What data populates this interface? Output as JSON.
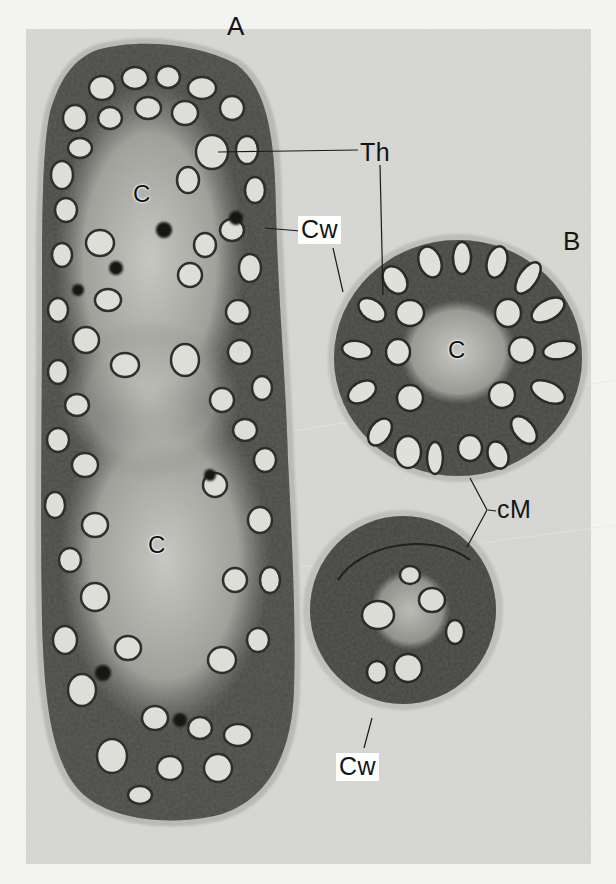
{
  "figure": {
    "background_color": "#f3f3f1",
    "panel_color": "#d8d8d5",
    "cell_dark": "#3a3a38",
    "cell_mid": "#8a8a86",
    "thylakoid_light": "#e2e2de",
    "panels": [
      {
        "id": "A",
        "label": "A"
      },
      {
        "id": "B",
        "label": "B"
      }
    ],
    "labels": {
      "panel_a": "A",
      "panel_b": "B",
      "thylakoid": "Th",
      "cell_wall_top": "Cw",
      "cell_wall_bottom": "Cw",
      "center_a_upper": "C",
      "center_a_lower": "C",
      "center_b": "C",
      "cell_membrane": "cM"
    }
  }
}
